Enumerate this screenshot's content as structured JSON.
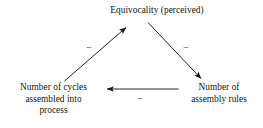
{
  "diagram": {
    "type": "causal-loop-triangle",
    "background_color": "#ffffff",
    "line_color": "#1a1a1a",
    "nodes": [
      {
        "id": "equivocality",
        "label": "Equivocality (perceived)",
        "position": "top-center"
      },
      {
        "id": "cycles",
        "label": "Number of cycles\nassembled into\nprocess",
        "position": "bottom-left"
      },
      {
        "id": "rules",
        "label": "Number of\nassembly rules",
        "position": "bottom-right"
      }
    ],
    "edges": [
      {
        "id": "cycles-to-equivocality",
        "from": "cycles",
        "to": "equivocality",
        "sign": "−",
        "direction": "up-right"
      },
      {
        "id": "equivocality-to-rules",
        "from": "equivocality",
        "to": "rules",
        "sign": "−",
        "direction": "down-right"
      },
      {
        "id": "rules-to-cycles",
        "from": "rules",
        "to": "cycles",
        "sign": "−",
        "direction": "left"
      }
    ]
  }
}
